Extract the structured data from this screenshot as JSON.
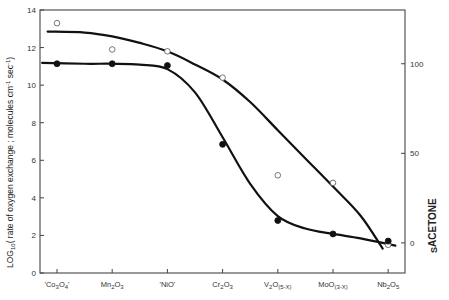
{
  "chart_data": {
    "type": "line",
    "title": "",
    "categories": [
      {
        "main": "'Co",
        "sub1": "3",
        "mid": "O",
        "sub2": "4",
        "tail": "'"
      },
      {
        "main": "Mn",
        "sub1": "2",
        "mid": "O",
        "sub2": "3",
        "tail": ""
      },
      {
        "main": "'NiO'",
        "sub1": "",
        "mid": "",
        "sub2": "",
        "tail": ""
      },
      {
        "main": "Cr",
        "sub1": "2",
        "mid": "O",
        "sub2": "3",
        "tail": ""
      },
      {
        "main": "V",
        "sub1": "2",
        "mid": "O",
        "sub2": "(5-X)",
        "tail": ""
      },
      {
        "main": "Mo",
        "sub1": "",
        "mid": "O",
        "sub2": "(3-X)",
        "tail": ""
      },
      {
        "main": "Nb",
        "sub1": "2",
        "mid": "O",
        "sub2": "5",
        "tail": ""
      }
    ],
    "category_names": [
      "'Co3O4'",
      "Mn2O3",
      "'NiO'",
      "Cr2O3",
      "V2O(5-X)",
      "MoO(3-X)",
      "Nb2O5"
    ],
    "left_axis": {
      "label_main": "LOG",
      "label_sub": "10",
      "label_rest": "( rate  of  oxygen  exchange ;  molecules  cm",
      "label_sup1": "-1",
      "label_sec": " sec",
      "label_sup2": "-1",
      "label_close": ")",
      "ylim": [
        0,
        14
      ],
      "ticks": [
        0,
        2,
        4,
        6,
        8,
        10,
        12,
        14
      ]
    },
    "right_axis": {
      "label_main": "S",
      "label_sub": "ACETONE",
      "ylim": [
        -16.8,
        130
      ],
      "ticks": [
        0,
        50,
        100
      ]
    },
    "series": [
      {
        "name": "log10 rate of oxygen exchange",
        "axis": "left",
        "marker": "open-circle",
        "values": [
          13.3,
          11.9,
          11.8,
          10.4,
          5.2,
          4.8,
          1.5
        ],
        "fit_curve": [
          [
            -0.17,
            12.85
          ],
          [
            0.5,
            12.8
          ],
          [
            1,
            12.6
          ],
          [
            1.5,
            12.25
          ],
          [
            2,
            11.8
          ],
          [
            2.5,
            11.1
          ],
          [
            3,
            10.3
          ],
          [
            3.5,
            9.1
          ],
          [
            4,
            7.6
          ],
          [
            4.5,
            6.1
          ],
          [
            5,
            4.6
          ],
          [
            5.5,
            3.05
          ],
          [
            5.9,
            1.3
          ]
        ]
      },
      {
        "name": "S acetone",
        "axis": "right",
        "marker": "filled-circle",
        "values": [
          100,
          100,
          99,
          55,
          12.5,
          5,
          1
        ],
        "fit_curve": [
          [
            -0.27,
            100.5
          ],
          [
            0.5,
            100
          ],
          [
            1,
            100
          ],
          [
            1.5,
            99.5
          ],
          [
            2,
            97
          ],
          [
            2.5,
            84
          ],
          [
            3,
            59
          ],
          [
            3.5,
            33
          ],
          [
            4,
            15
          ],
          [
            4.5,
            8
          ],
          [
            5,
            5
          ],
          [
            5.5,
            2.5
          ],
          [
            6.13,
            -1.5
          ]
        ]
      }
    ],
    "grid": false,
    "legend": "none"
  }
}
